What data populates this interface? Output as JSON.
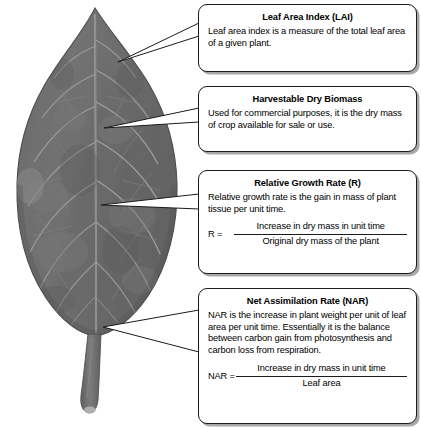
{
  "figure": {
    "colors": {
      "leaf_blade": "#6e6e6e",
      "leaf_blade_dark": "#5e5e5e",
      "leaf_vein": "#9c9c9c",
      "leaf_edge": "#4a4a4a",
      "petiole": "#757575",
      "box_border": "#1b1b1b",
      "box_fill": "#ffffff",
      "box_shadow": "#a8a8a8",
      "pointer_fill": "#ffffff",
      "pointer_stroke": "#1b1b1b"
    }
  },
  "callouts": [
    {
      "id": "lai",
      "title": "Leaf Area Index (LAI)",
      "body": "Leaf area index is a measure of the total leaf area of a given plant."
    },
    {
      "id": "harvestable_dry_biomass",
      "title": "Harvestable Dry Biomass",
      "body": "Used for commercial purposes, it is the dry mass of crop available for sale or use."
    },
    {
      "id": "relative_growth_rate",
      "title": "Relative Growth Rate (R)",
      "body": "Relative growth rate is the gain in mass of plant tissue per unit time.",
      "equation": {
        "lhs": "R =",
        "numerator": "Increase in dry mass in unit time",
        "denominator": "Original dry mass of the plant"
      }
    },
    {
      "id": "net_assimilation_rate",
      "title": "Net Assimilation Rate (NAR)",
      "body": "NAR is the increase in plant weight per unit of leaf area per unit time. Essentially it is the balance between carbon gain from photosynthesis and carbon loss from respiration.",
      "equation": {
        "lhs": "NAR =",
        "numerator": "Increase in dry mass in unit time",
        "denominator": "Leaf area"
      }
    }
  ]
}
